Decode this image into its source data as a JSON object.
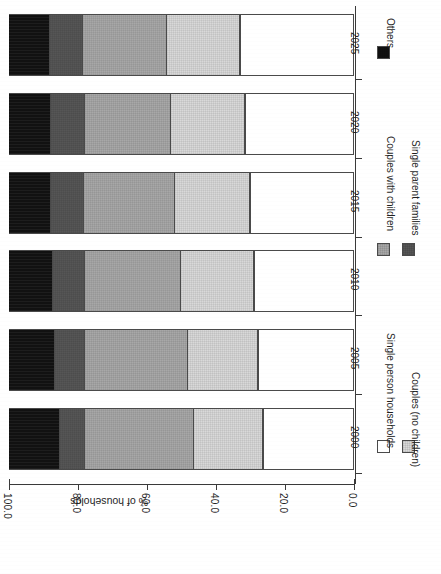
{
  "chart_data": {
    "type": "bar",
    "subtype": "stacked-horizontal-100pct",
    "title": "",
    "xlabel": "",
    "ylabel": "% of households",
    "categories": [
      "2000",
      "2005",
      "2010",
      "2015",
      "2020",
      "2025"
    ],
    "value_axis": {
      "label": "% of households",
      "tick_labels": [
        "100.0",
        "80.0",
        "60.0",
        "40.0",
        "20.0",
        "0.0"
      ],
      "tick_values": [
        100.0,
        80.0,
        60.0,
        40.0,
        20.0,
        0.0
      ],
      "lim": [
        0.0,
        100.0
      ],
      "direction": "reversed",
      "grid": false
    },
    "legend": {
      "position": "right",
      "entries": [
        {
          "name": "Single person households",
          "color": "#ffffff"
        },
        {
          "name": "Couples (no children)",
          "color": "#d9d9d9"
        },
        {
          "name": "Couples with children",
          "color": "#a8a8a8"
        },
        {
          "name": "Single parent families",
          "color": "#565656"
        },
        {
          "name": "Others",
          "color": "#111111"
        }
      ]
    },
    "series": [
      {
        "name": "Single person households",
        "color": "#ffffff",
        "values": [
          26.4,
          27.8,
          29.0,
          30.1,
          31.6,
          33.0
        ]
      },
      {
        "name": "Couples (no children)",
        "color": "#d9d9d9",
        "values": [
          20.0,
          20.3,
          21.2,
          21.7,
          21.4,
          21.2
        ]
      },
      {
        "name": "Couples with children",
        "color": "#a8a8a8",
        "values": [
          31.6,
          29.9,
          27.8,
          26.4,
          24.9,
          24.3
        ]
      },
      {
        "name": "Single parent families",
        "color": "#565656",
        "values": [
          7.2,
          8.7,
          9.3,
          9.6,
          9.9,
          9.6
        ]
      },
      {
        "name": "Others",
        "color": "#111111",
        "values": [
          14.8,
          13.3,
          12.7,
          12.2,
          12.2,
          11.9
        ]
      }
    ]
  }
}
